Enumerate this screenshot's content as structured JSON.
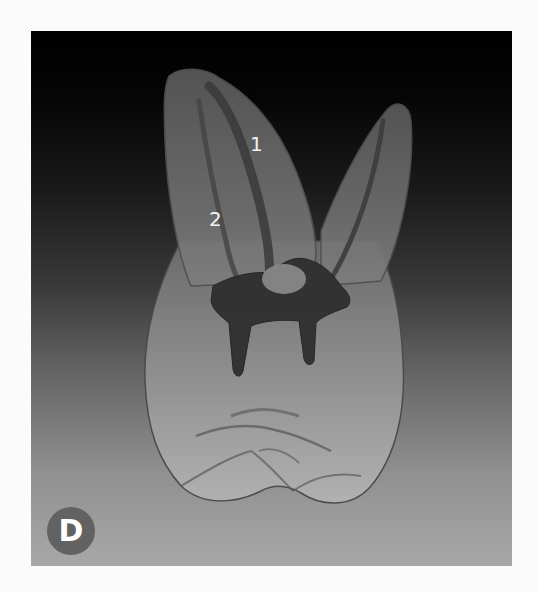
{
  "figure": {
    "panel_letter": "D",
    "annotations": [
      {
        "id": "label-1",
        "text": "1"
      },
      {
        "id": "label-2",
        "text": "2"
      }
    ],
    "colors": {
      "background_top": "#000000",
      "background_bottom": "#a8a8a8",
      "badge": "#626262",
      "label_text": "#f2f2f2",
      "tooth_fill": "#9a9a9a",
      "canal_fill": "#3b3b3b"
    }
  }
}
